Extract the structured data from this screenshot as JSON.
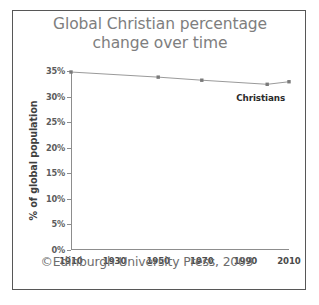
{
  "figure": {
    "title_line1": "Global Christian percentage",
    "title_line2": "change over time",
    "title_color": "#7e7e7e",
    "frame_color": "#575757",
    "background": "#ffffff",
    "credit": "©Edinburgh University Press, 2009"
  },
  "chart_data": {
    "type": "line",
    "title": "Global Christian percentage change over time",
    "xlabel": "",
    "ylabel": "% of global population",
    "x": [
      1910,
      1950,
      1970,
      2000,
      2010
    ],
    "series": [
      {
        "name": "Christians",
        "values": [
          34.8,
          33.8,
          33.2,
          32.4,
          32.9
        ],
        "color": "#9a9a9a",
        "marker_color": "#7a7a7a",
        "marker": "square",
        "annotation": "Christians"
      }
    ],
    "xlim": [
      1910,
      2010
    ],
    "ylim": [
      0,
      35
    ],
    "xticks": [
      1910,
      1930,
      1950,
      1970,
      1990,
      2010
    ],
    "xtick_labels": [
      "1910",
      "1930",
      "1950",
      "1970",
      "1990",
      "2010"
    ],
    "yticks": [
      0,
      5,
      10,
      15,
      20,
      25,
      30,
      35
    ],
    "ytick_labels": [
      "0%",
      "5%",
      "10%",
      "15%",
      "20%",
      "25%",
      "30%",
      "35%"
    ],
    "grid": false,
    "legend": "inline-annotation",
    "axis_color": "#8d8d8d"
  }
}
